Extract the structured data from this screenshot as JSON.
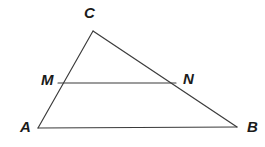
{
  "figure": {
    "background_color": "#ffffff",
    "stroke_color": "#3a3a3a",
    "label_color": "#1b1b1b",
    "canvas": {
      "width": 265,
      "height": 147
    },
    "points": {
      "A": {
        "label": "A",
        "x": 38,
        "y": 128,
        "label_x": 20,
        "label_y": 119
      },
      "B": {
        "label": "B",
        "x": 237,
        "y": 127,
        "label_x": 247,
        "label_y": 119
      },
      "C": {
        "label": "C",
        "x": 93,
        "y": 31,
        "label_x": 84,
        "label_y": 5
      },
      "M": {
        "label": "M",
        "x": 58,
        "y": 83,
        "label_x": 41,
        "label_y": 72
      },
      "N": {
        "label": "N",
        "x": 176,
        "y": 83,
        "label_x": 183,
        "label_y": 71
      }
    },
    "segments": [
      {
        "name": "segment-AC",
        "from": "A",
        "to": "C",
        "x1": 38,
        "y1": 128,
        "x2": 93,
        "y2": 31
      },
      {
        "name": "segment-CB",
        "from": "C",
        "to": "B",
        "x1": 93,
        "y1": 31,
        "x2": 237,
        "y2": 127
      },
      {
        "name": "segment-AB",
        "from": "A",
        "to": "B",
        "x1": 38,
        "y1": 128,
        "x2": 237,
        "y2": 127
      },
      {
        "name": "segment-MN",
        "from": "M",
        "to": "N",
        "x1": 58,
        "y1": 83,
        "x2": 176,
        "y2": 83
      }
    ]
  }
}
